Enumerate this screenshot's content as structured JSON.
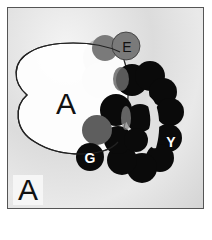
{
  "figure": {
    "panel_label": "A",
    "subunits": {
      "large": {
        "label": "A",
        "color": "#ffffff"
      },
      "e": {
        "label": "E",
        "color": "#707070"
      },
      "g": {
        "label": "G",
        "color": "#0a0a0a"
      },
      "y": {
        "label": "Y",
        "color": "#0a0a0a"
      }
    },
    "colors": {
      "ring": "#0a0a0a",
      "overlap_gray": "#6a6a6a",
      "light_gray": "#b8b8b8",
      "outline": "#222222"
    }
  }
}
